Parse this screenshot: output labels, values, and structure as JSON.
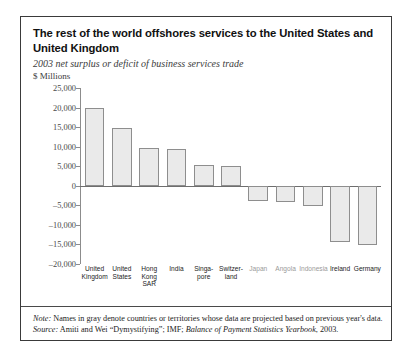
{
  "figure": {
    "title": "The rest of the world offshores services to the United States and United Kingdom",
    "subtitle": "2003 net surplus or deficit of business services trade",
    "units": "$ Millions",
    "note_label": "Note:",
    "note_text": " Names in gray denote countries or territories whose data are projected based on previous year's data.",
    "source_label": "Source:",
    "source_text_a": " Amiti and Wei “Dymystifying”; IMF; ",
    "source_italic": "Balance of Payment Statistics Yearbook",
    "source_text_b": ", 2003."
  },
  "chart_data": {
    "type": "bar",
    "title": "The rest of the world offshores services to the United States and United Kingdom",
    "subtitle": "2003 net surplus or deficit of business services trade",
    "xlabel": "",
    "ylabel": "$ Millions",
    "ylim": [
      -20000,
      25000
    ],
    "ytick_step": 5000,
    "grid": false,
    "legend": "none",
    "yticks": [
      25000,
      20000,
      15000,
      10000,
      5000,
      0,
      -5000,
      -10000,
      -15000,
      -20000
    ],
    "ytick_labels": [
      "25,000",
      "20,000",
      "15,000",
      "10,000",
      "5,000",
      "0",
      "–5,000",
      "–10,000",
      "–15,000",
      "–20,000"
    ],
    "categories": [
      "United Kingdom",
      "United States",
      "Hong Kong SAR",
      "India",
      "Singapore",
      "Switzerland",
      "Japan",
      "Angola",
      "Indonesia",
      "Ireland",
      "Germany"
    ],
    "category_lines": [
      [
        "United",
        "Kingdom"
      ],
      [
        "United",
        "States"
      ],
      [
        "Hong",
        "Kong",
        "SAR"
      ],
      [
        "India"
      ],
      [
        "Singa-",
        "pore"
      ],
      [
        "Switzer-",
        "land"
      ],
      [
        "Japan"
      ],
      [
        "Angola"
      ],
      [
        "Indonesia"
      ],
      [
        "Ireland"
      ],
      [
        "Germany"
      ]
    ],
    "category_projected": [
      false,
      false,
      false,
      false,
      false,
      false,
      true,
      true,
      true,
      false,
      false
    ],
    "values": [
      19800,
      14800,
      9700,
      9500,
      5200,
      5000,
      -3800,
      -4200,
      -5200,
      -14500,
      -15200
    ],
    "bar_fill": "#eaeaea",
    "bar_stroke": "#8e8e8e"
  }
}
